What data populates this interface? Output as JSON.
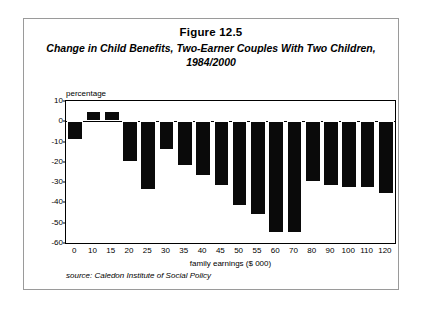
{
  "figure": {
    "number": "Figure 12.5",
    "title": "Change in Child Benefits, Two-Earner Couples With Two Children, 1984/2000",
    "source": "source: Caledon Institute of Social Policy"
  },
  "chart_data": {
    "type": "bar",
    "title": "Change in Child Benefits, Two-Earner Couples With Two Children, 1984/2000",
    "xlabel": "family earnings ($ 000)",
    "ylabel": "percentage",
    "categories": [
      "0",
      "10",
      "15",
      "20",
      "25",
      "30",
      "35",
      "40",
      "45",
      "50",
      "55",
      "60",
      "70",
      "80",
      "90",
      "100",
      "110",
      "120"
    ],
    "values": [
      -9,
      5,
      5,
      -20,
      -34,
      -14,
      -22,
      -27,
      -32,
      -42,
      -46,
      -55,
      -55,
      -30,
      -32,
      -33,
      -33,
      -36
    ],
    "ylim": [
      -60,
      10
    ],
    "yticks": [
      10,
      0,
      -10,
      -20,
      -30,
      -40,
      -50,
      -60
    ],
    "ytick_labels": [
      "10",
      "0",
      "-10",
      "-20",
      "-30",
      "-40",
      "-50",
      "-60"
    ],
    "grid": false,
    "legend": "none",
    "bar_color": "#0a0a0a"
  }
}
